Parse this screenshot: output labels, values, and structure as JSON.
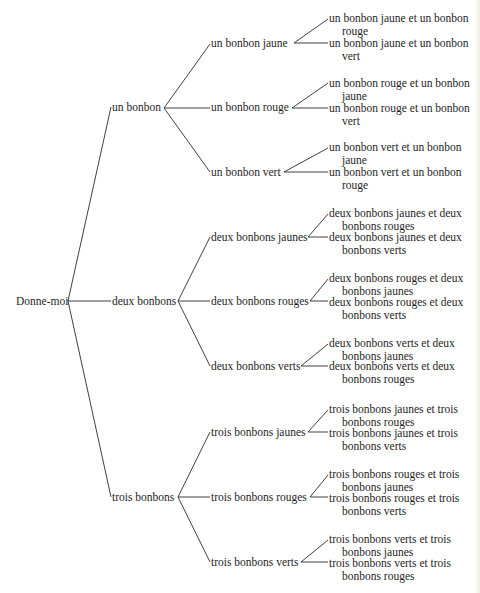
{
  "diagram": {
    "type": "tree",
    "root": "Donne-moi",
    "level1": [
      {
        "label": "un bonbon",
        "children": [
          {
            "label": "un bonbon jaune",
            "leaves": [
              {
                "line1": "un bonbon jaune et un bonbon",
                "line2": "rouge"
              },
              {
                "line1": "un bonbon jaune et un bonbon",
                "line2": "vert"
              }
            ]
          },
          {
            "label": "un bonbon rouge",
            "leaves": [
              {
                "line1": "un bonbon rouge et un bonbon",
                "line2": "jaune"
              },
              {
                "line1": "un bonbon rouge et un bonbon",
                "line2": "vert"
              }
            ]
          },
          {
            "label": "un bonbon vert",
            "leaves": [
              {
                "line1": "un bonbon vert et un bonbon",
                "line2": "jaune"
              },
              {
                "line1": "un bonbon vert et un bonbon",
                "line2": "rouge"
              }
            ]
          }
        ]
      },
      {
        "label": "deux bonbons",
        "children": [
          {
            "label": "deux bonbons jaunes",
            "leaves": [
              {
                "line1": "deux bonbons jaunes et deux",
                "line2": "bonbons rouges"
              },
              {
                "line1": "deux bonbons jaunes et deux",
                "line2": "bonbons verts"
              }
            ]
          },
          {
            "label": "deux bonbons rouges",
            "leaves": [
              {
                "line1": "deux bonbons rouges et deux",
                "line2": "bonbons jaunes"
              },
              {
                "line1": "deux bonbons rouges et deux",
                "line2": "bonbons verts"
              }
            ]
          },
          {
            "label": "deux bonbons verts",
            "leaves": [
              {
                "line1": "deux bonbons verts et deux",
                "line2": "bonbons jaunes"
              },
              {
                "line1": "deux bonbons verts et deux",
                "line2": "bonbons rouges"
              }
            ]
          }
        ]
      },
      {
        "label": "trois bonbons",
        "children": [
          {
            "label": "trois bonbons jaunes",
            "leaves": [
              {
                "line1": "trois bonbons jaunes et trois",
                "line2": "bonbons rouges"
              },
              {
                "line1": "trois bonbons jaunes et trois",
                "line2": "bonbons verts"
              }
            ]
          },
          {
            "label": "trois bonbons rouges",
            "leaves": [
              {
                "line1": "trois bonbons rouges et trois",
                "line2": "bonbons jaunes"
              },
              {
                "line1": "trois bonbons rouges et trois",
                "line2": "bonbons verts"
              }
            ]
          },
          {
            "label": "trois bonbons verts",
            "leaves": [
              {
                "line1": "trois bonbons verts et trois",
                "line2": "bonbons jaunes"
              },
              {
                "line1": "trois bonbons verts et trois",
                "line2": "bonbons rouges"
              }
            ]
          }
        ]
      }
    ]
  }
}
